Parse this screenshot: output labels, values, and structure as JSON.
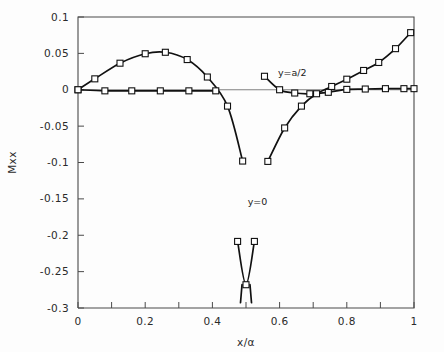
{
  "chart_data": {
    "type": "line",
    "title": "",
    "xlabel": "x/α",
    "ylabel": "Mxx",
    "xlim": [
      0,
      1
    ],
    "ylim": [
      -0.3,
      0.1
    ],
    "grid": false,
    "legend_position": "inline-annotations",
    "x_ticks": [
      0,
      0.1,
      0.2,
      0.3,
      0.4,
      0.5,
      0.6,
      0.7,
      0.8,
      0.9,
      1
    ],
    "x_tick_labels": [
      "0",
      "",
      "0.2",
      "",
      "0.4",
      "",
      "0.6",
      "",
      "0.8",
      "",
      "1"
    ],
    "y_ticks": [
      0.1,
      0.05,
      0,
      -0.05,
      -0.1,
      -0.15,
      -0.2,
      -0.25,
      -0.3
    ],
    "y_tick_labels": [
      "0.1",
      "0.05",
      "0",
      "-0.05",
      "-0.1",
      "-0.15",
      "-0.2",
      "-0.25",
      "-0.3"
    ],
    "annotations": [
      {
        "text": "y=a/2",
        "x": 0.595,
        "y": 0.019
      },
      {
        "text": "y=0",
        "x": 0.505,
        "y": -0.158
      }
    ],
    "series": [
      {
        "name": "y=a/2",
        "marker": "open-square",
        "points": [
          {
            "x": 0.0,
            "y": 0.0
          },
          {
            "x": 0.05,
            "y": 0.015
          },
          {
            "x": 0.125,
            "y": 0.0365
          },
          {
            "x": 0.2,
            "y": 0.0495
          },
          {
            "x": 0.26,
            "y": 0.0515
          },
          {
            "x": 0.325,
            "y": 0.0415
          },
          {
            "x": 0.385,
            "y": 0.0175
          },
          {
            "x": 0.445,
            "y": -0.0225
          },
          {
            "x": 0.49,
            "y": -0.098
          },
          {
            "x": 0.555,
            "y": 0.0185
          },
          {
            "x": 0.6,
            "y": 0.0
          },
          {
            "x": 0.645,
            "y": -0.0045
          },
          {
            "x": 0.69,
            "y": -0.0055
          },
          {
            "x": 0.745,
            "y": -0.0035
          },
          {
            "x": 0.8,
            "y": 0.0005
          },
          {
            "x": 0.855,
            "y": 0.001
          },
          {
            "x": 0.915,
            "y": 0.0015
          },
          {
            "x": 0.97,
            "y": 0.0015
          },
          {
            "x": 1.0,
            "y": 0.0015
          }
        ]
      },
      {
        "name": "y=0",
        "marker": "open-square",
        "points": [
          {
            "x": 0.0,
            "y": 0.0
          },
          {
            "x": 0.08,
            "y": -0.0015
          },
          {
            "x": 0.16,
            "y": -0.0015
          },
          {
            "x": 0.245,
            "y": -0.0015
          },
          {
            "x": 0.33,
            "y": -0.0015
          },
          {
            "x": 0.41,
            "y": -0.0015
          },
          {
            "x": 0.475,
            "y": -0.2085
          },
          {
            "x": 0.5,
            "y": -0.268
          },
          {
            "x": 0.525,
            "y": -0.2085
          },
          {
            "x": 0.565,
            "y": -0.0985
          },
          {
            "x": 0.615,
            "y": -0.0525
          },
          {
            "x": 0.665,
            "y": -0.0225
          },
          {
            "x": 0.71,
            "y": -0.0055
          },
          {
            "x": 0.755,
            "y": 0.0045
          },
          {
            "x": 0.8,
            "y": 0.0145
          },
          {
            "x": 0.85,
            "y": 0.0265
          },
          {
            "x": 0.895,
            "y": 0.0375
          },
          {
            "x": 0.945,
            "y": 0.0565
          },
          {
            "x": 0.99,
            "y": 0.0785
          }
        ]
      }
    ]
  },
  "axis": {
    "y_label": "Mxx",
    "x_label": "x/α"
  }
}
